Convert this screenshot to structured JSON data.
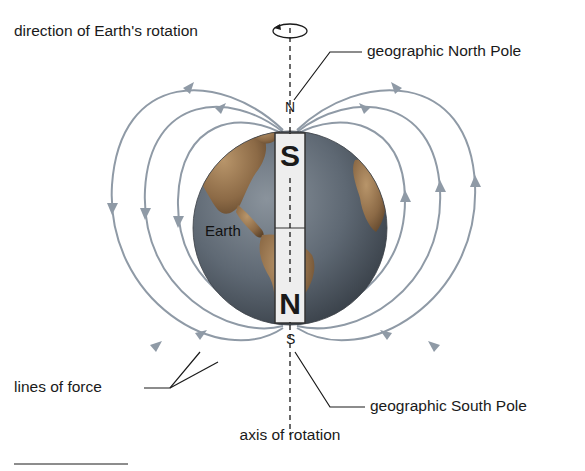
{
  "diagram": {
    "labels": {
      "rotation_direction": "direction of Earth's rotation",
      "north_pole": "geographic North Pole",
      "south_pole": "geographic South Pole",
      "lines_of_force": "lines of force",
      "axis": "axis of rotation",
      "earth": "Earth"
    },
    "pole_letters": {
      "north": "N",
      "south": "S"
    },
    "magnet": {
      "top_letter": "S",
      "bottom_letter": "N"
    },
    "colors": {
      "field_lines": "#8f9aa6",
      "ocean": "#5d6772",
      "land": "#9c7a55",
      "magnet": "#eeeeee",
      "text": "#1a1a1a"
    }
  }
}
